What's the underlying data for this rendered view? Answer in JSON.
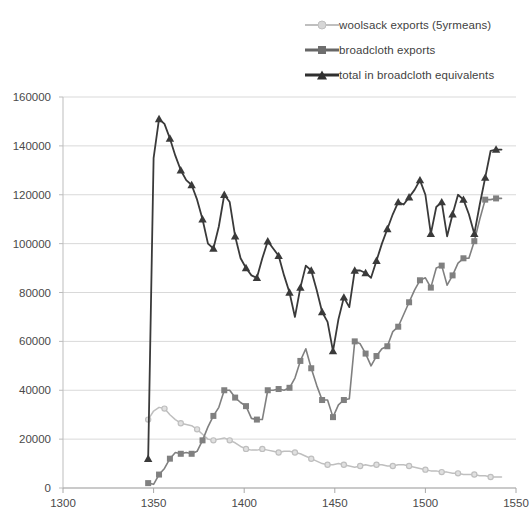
{
  "chart_data": {
    "type": "line",
    "title": "",
    "xlabel": "",
    "ylabel": "",
    "xlim": [
      1300,
      1550
    ],
    "ylim": [
      0,
      160000
    ],
    "xticks": [
      1300,
      1350,
      1400,
      1450,
      1500,
      1550
    ],
    "yticks": [
      0,
      20000,
      40000,
      60000,
      80000,
      100000,
      120000,
      140000,
      160000
    ],
    "grid": "horizontal",
    "legend_position": "top-right",
    "colors": {
      "woolsack": "#bfbfbf",
      "broadcloth": "#808080",
      "total": "#3a3a3a",
      "gridline": "#d9d9d9",
      "axis": "#bdbdbd"
    },
    "series": [
      {
        "name": "woolsack exports (5yrmeans)",
        "marker": "diamond",
        "color": "#bfbfbf",
        "x": [
          1347,
          1350,
          1353,
          1356,
          1359,
          1362,
          1365,
          1368,
          1371,
          1374,
          1377,
          1380,
          1383,
          1386,
          1389,
          1392,
          1395,
          1398,
          1401,
          1404,
          1407,
          1410,
          1413,
          1416,
          1419,
          1422,
          1425,
          1428,
          1431,
          1434,
          1437,
          1440,
          1443,
          1446,
          1449,
          1452,
          1455,
          1458,
          1461,
          1464,
          1467,
          1470,
          1473,
          1476,
          1479,
          1482,
          1485,
          1488,
          1491,
          1494,
          1497,
          1500,
          1503,
          1506,
          1509,
          1512,
          1515,
          1518,
          1521,
          1524,
          1527,
          1530,
          1533,
          1536,
          1539,
          1542
        ],
        "y": [
          28000,
          31500,
          33000,
          32500,
          30000,
          28000,
          26500,
          26000,
          25500,
          24000,
          22000,
          20000,
          19500,
          20000,
          20500,
          19500,
          18500,
          17000,
          16000,
          15500,
          15500,
          16000,
          15500,
          15000,
          14500,
          15000,
          15000,
          14500,
          14000,
          13000,
          12000,
          11000,
          10000,
          9500,
          9500,
          10000,
          9500,
          9000,
          8500,
          9000,
          9500,
          9000,
          9500,
          9500,
          9000,
          9000,
          9500,
          9500,
          9000,
          8500,
          8000,
          7500,
          7000,
          7000,
          6500,
          6500,
          6000,
          6000,
          5500,
          5500,
          5500,
          5000,
          5000,
          4500,
          4500,
          4500
        ]
      },
      {
        "name": "broadcloth exports",
        "marker": "square",
        "color": "#808080",
        "x": [
          1347,
          1350,
          1353,
          1356,
          1359,
          1362,
          1365,
          1368,
          1371,
          1374,
          1377,
          1380,
          1383,
          1386,
          1389,
          1392,
          1395,
          1398,
          1401,
          1404,
          1407,
          1410,
          1413,
          1416,
          1419,
          1422,
          1425,
          1428,
          1431,
          1434,
          1437,
          1440,
          1443,
          1446,
          1449,
          1452,
          1455,
          1458,
          1461,
          1464,
          1467,
          1470,
          1473,
          1476,
          1479,
          1482,
          1485,
          1488,
          1491,
          1494,
          1497,
          1500,
          1503,
          1506,
          1509,
          1512,
          1515,
          1518,
          1521,
          1524,
          1527,
          1530,
          1533,
          1536,
          1539,
          1542
        ],
        "y": [
          2000,
          1500,
          5500,
          8000,
          12000,
          14500,
          14000,
          14500,
          14000,
          15000,
          19500,
          25000,
          29500,
          33000,
          40000,
          40000,
          37000,
          35000,
          33500,
          28500,
          28000,
          28000,
          40000,
          40000,
          40500,
          40000,
          41000,
          45000,
          52000,
          57000,
          49000,
          42000,
          36000,
          36000,
          29000,
          34000,
          36000,
          36500,
          60000,
          59000,
          55000,
          50000,
          54000,
          57000,
          58000,
          64000,
          66000,
          71000,
          76000,
          81000,
          85000,
          86000,
          82000,
          90000,
          91000,
          83000,
          87000,
          92000,
          94000,
          94000,
          101000,
          110000,
          118000,
          118000,
          118500,
          118500
        ]
      },
      {
        "name": "total in broadcloth equivalents",
        "marker": "triangle",
        "color": "#3a3a3a",
        "x": [
          1347,
          1350,
          1353,
          1356,
          1359,
          1362,
          1365,
          1368,
          1371,
          1374,
          1377,
          1380,
          1383,
          1386,
          1389,
          1392,
          1395,
          1398,
          1401,
          1404,
          1407,
          1410,
          1413,
          1416,
          1419,
          1422,
          1425,
          1428,
          1431,
          1434,
          1437,
          1440,
          1443,
          1446,
          1449,
          1452,
          1455,
          1458,
          1461,
          1464,
          1467,
          1470,
          1473,
          1476,
          1479,
          1482,
          1485,
          1488,
          1491,
          1494,
          1497,
          1500,
          1503,
          1506,
          1509,
          1512,
          1515,
          1518,
          1521,
          1524,
          1527,
          1530,
          1533,
          1536,
          1539,
          1542
        ],
        "y": [
          12000,
          135000,
          151000,
          149000,
          143000,
          136000,
          130000,
          126000,
          124000,
          118000,
          110000,
          100000,
          98000,
          107000,
          120000,
          117000,
          103000,
          94000,
          90000,
          87000,
          86000,
          94000,
          101000,
          98000,
          95000,
          87000,
          80000,
          70000,
          82000,
          91000,
          89000,
          81000,
          72000,
          68000,
          56000,
          69000,
          78000,
          74000,
          89000,
          89000,
          88000,
          86000,
          93000,
          100000,
          106000,
          112000,
          117000,
          116000,
          119000,
          122000,
          126000,
          120000,
          104000,
          115000,
          117000,
          103000,
          112000,
          120000,
          118000,
          112000,
          104000,
          116000,
          127000,
          138000,
          138500,
          138500
        ]
      }
    ]
  },
  "legend": {
    "items": [
      {
        "label": "woolsack exports (5yrmeans)",
        "marker": "diamond-marker-icon",
        "color": "#bfbfbf"
      },
      {
        "label": "broadcloth exports",
        "marker": "square-marker-icon",
        "color": "#808080"
      },
      {
        "label": "total in broadcloth equivalents",
        "marker": "triangle-marker-icon",
        "color": "#3a3a3a"
      }
    ]
  },
  "axes": {
    "y_tick_labels": [
      "160000",
      "140000",
      "120000",
      "100000",
      "80000",
      "60000",
      "40000",
      "20000",
      "0"
    ],
    "x_tick_labels": [
      "1300",
      "1350",
      "1400",
      "1450",
      "1500",
      "1550"
    ]
  }
}
